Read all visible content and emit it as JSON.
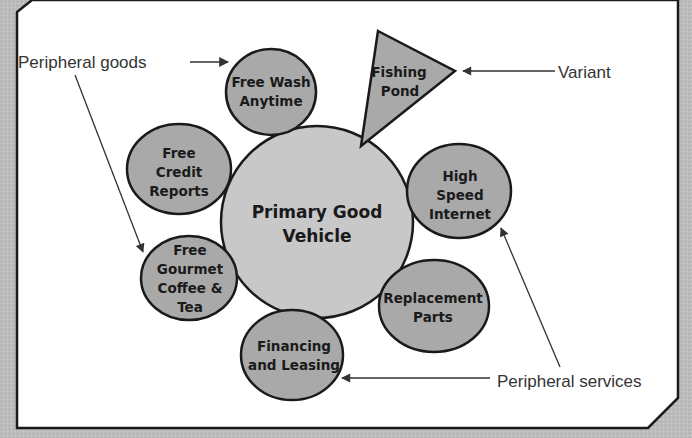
{
  "diagram": {
    "type": "product-concept-diagram",
    "center": {
      "lines": [
        "Primary Good",
        "Vehicle"
      ]
    },
    "peripheral_goods": [
      {
        "id": "free-wash",
        "lines": [
          "Free Wash",
          "Anytime"
        ]
      },
      {
        "id": "free-credit",
        "lines": [
          "Free",
          "Credit",
          "Reports"
        ]
      },
      {
        "id": "free-coffee",
        "lines": [
          "Free",
          "Gourmet",
          "Coffee &",
          "Tea"
        ]
      }
    ],
    "peripheral_services": [
      {
        "id": "high-speed-internet",
        "lines": [
          "High",
          "Speed",
          "Internet"
        ]
      },
      {
        "id": "replacement-parts",
        "lines": [
          "Replacement",
          "Parts"
        ]
      },
      {
        "id": "financing-leasing",
        "lines": [
          "Financing",
          "and Leasing"
        ]
      }
    ],
    "variant": {
      "lines": [
        "Fishing",
        "Pond"
      ]
    },
    "callouts": {
      "peripheral_goods": "Peripheral goods",
      "variant": "Variant",
      "peripheral_services": "Peripheral services"
    },
    "colors": {
      "background": "#bcbcbc",
      "panel": "#ffffff",
      "center_fill": "#c8c8c8",
      "node_fill": "#a9a9a9",
      "stroke": "#1a1a1a"
    }
  }
}
